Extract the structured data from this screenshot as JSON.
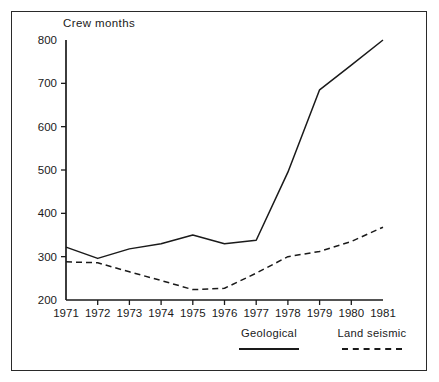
{
  "chart_data": {
    "type": "line",
    "title": "",
    "ylabel": "Crew months",
    "xlabel": "",
    "ylim": [
      200,
      800
    ],
    "yticks": [
      200,
      300,
      400,
      500,
      600,
      700,
      800
    ],
    "grid": false,
    "legend_position": "bottom-right",
    "x": [
      1971,
      1972,
      1973,
      1974,
      1975,
      1976,
      1977,
      1978,
      1979,
      1980,
      1981
    ],
    "categories": [
      "1971",
      "1972",
      "1973",
      "1974",
      "1975",
      "1976",
      "1977",
      "1978",
      "1979",
      "1980",
      "1981"
    ],
    "series": [
      {
        "name": "Geological",
        "style": "solid",
        "color": "#1a1a1a",
        "values": [
          322,
          296,
          318,
          330,
          350,
          330,
          338,
          495,
          685,
          742,
          800
        ]
      },
      {
        "name": "Land seismic",
        "style": "dashed",
        "color": "#1a1a1a",
        "values": [
          288,
          286,
          265,
          245,
          224,
          227,
          262,
          300,
          312,
          335,
          368
        ]
      }
    ]
  },
  "axis": {
    "y_title": "Crew months",
    "y_tick_labels": [
      "800",
      "700",
      "600",
      "500",
      "400",
      "300",
      "200"
    ],
    "x_tick_labels": [
      "1971",
      "1972",
      "1973",
      "1974",
      "1975",
      "1976",
      "1977",
      "1978",
      "1979",
      "1980",
      "1981"
    ]
  },
  "legend": {
    "items": [
      {
        "label": "Geological",
        "style": "solid"
      },
      {
        "label": "Land seismic",
        "style": "dashed"
      }
    ]
  }
}
